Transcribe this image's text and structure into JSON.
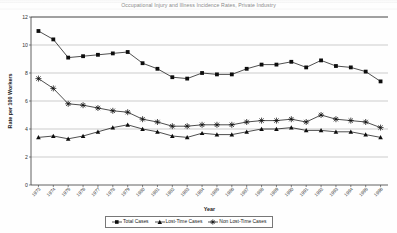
{
  "title": "Occupational Injury and Illness Incidence Rates, Private Industry",
  "axis": {
    "ylabel": "Rate per 100 Workers",
    "xlabel": "Year",
    "yticks": [
      "0",
      "2",
      "4",
      "6",
      "8",
      "10",
      "12"
    ],
    "ylim": [
      0,
      12
    ]
  },
  "legend": {
    "items": [
      {
        "label": "Total Cases",
        "marker": "square"
      },
      {
        "label": "Lost-Time Cases",
        "marker": "triangle"
      },
      {
        "label": "Non Lost-Time Cases",
        "marker": "asterisk"
      }
    ]
  },
  "chart_data": {
    "type": "line",
    "title": "Occupational Injury and Illness Incidence Rates, Private Industry",
    "xlabel": "Year",
    "ylabel": "Rate per 100 Workers",
    "ylim": [
      0,
      12
    ],
    "grid": true,
    "legend_position": "bottom",
    "categories": [
      "1973",
      "1974",
      "1975",
      "1976",
      "1977",
      "1978",
      "1979",
      "1980",
      "1981",
      "1982",
      "1983",
      "1984",
      "1985",
      "1986",
      "1987",
      "1988",
      "1989",
      "1990",
      "1991",
      "1992",
      "1993",
      "1994",
      "1995",
      "1996"
    ],
    "series": [
      {
        "name": "Total Cases",
        "marker": "square",
        "values": [
          11.0,
          10.4,
          9.1,
          9.2,
          9.3,
          9.4,
          9.5,
          8.7,
          8.3,
          7.7,
          7.6,
          8.0,
          7.9,
          7.9,
          8.3,
          8.6,
          8.6,
          8.8,
          8.4,
          8.9,
          8.5,
          8.4,
          8.1,
          7.4
        ]
      },
      {
        "name": "Lost-Time Cases",
        "marker": "triangle",
        "values": [
          3.4,
          3.5,
          3.3,
          3.5,
          3.8,
          4.1,
          4.3,
          4.0,
          3.8,
          3.5,
          3.4,
          3.7,
          3.6,
          3.6,
          3.8,
          4.0,
          4.0,
          4.1,
          3.9,
          3.9,
          3.8,
          3.8,
          3.6,
          3.4
        ]
      },
      {
        "name": "Non Lost-Time Cases",
        "marker": "asterisk",
        "values": [
          7.6,
          6.9,
          5.8,
          5.7,
          5.5,
          5.3,
          5.2,
          4.7,
          4.5,
          4.2,
          4.2,
          4.3,
          4.3,
          4.3,
          4.5,
          4.6,
          4.6,
          4.7,
          4.5,
          5.0,
          4.7,
          4.6,
          4.5,
          4.1
        ]
      }
    ]
  }
}
